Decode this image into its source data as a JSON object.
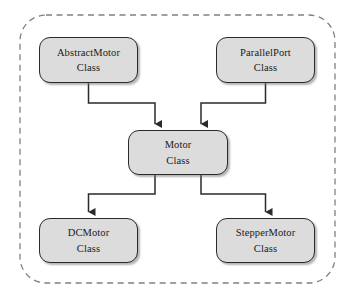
{
  "diagram": {
    "type": "class-hierarchy",
    "container": {
      "name": "dashed-group-boundary",
      "style": "dashed",
      "stroke_color": "#808080"
    },
    "colors": {
      "node_fill": "#dcdcdc",
      "node_border": "#2b2b2b",
      "connector": "#2b2b2b",
      "dashed_border": "#808080",
      "background": "#ffffff"
    },
    "nodes": [
      {
        "id": "abstractmotor",
        "title": "AbstractMotor",
        "subtitle": "Class"
      },
      {
        "id": "parallelport",
        "title": "ParallelPort",
        "subtitle": "Class"
      },
      {
        "id": "motor",
        "title": "Motor",
        "subtitle": "Class"
      },
      {
        "id": "dcmotor",
        "title": "DCMotor",
        "subtitle": "Class"
      },
      {
        "id": "steppermotor",
        "title": "StepperMotor",
        "subtitle": "Class"
      }
    ],
    "connections": [
      {
        "from": "abstractmotor",
        "to": "motor",
        "arrow": "filled-triangle"
      },
      {
        "from": "parallelport",
        "to": "motor",
        "arrow": "filled-triangle"
      },
      {
        "from": "motor",
        "to": "dcmotor",
        "arrow": "filled-triangle"
      },
      {
        "from": "motor",
        "to": "steppermotor",
        "arrow": "filled-triangle"
      }
    ]
  }
}
